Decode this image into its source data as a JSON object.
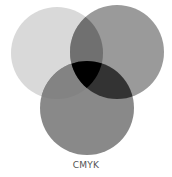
{
  "diagram": {
    "type": "venn",
    "label": "CMYK",
    "circles": [
      {
        "name": "left",
        "cx": 57,
        "cy": 53,
        "r": 46,
        "color": "#d9d9d9"
      },
      {
        "name": "right",
        "cx": 117,
        "cy": 52,
        "r": 47,
        "color": "#9a9a9a"
      },
      {
        "name": "bottom",
        "cx": 87,
        "cy": 108,
        "r": 47,
        "color": "#898989"
      }
    ],
    "overlaps": {
      "left_right": "#707070",
      "left_bottom": "#838383",
      "right_bottom": "#333333",
      "all": "#000000"
    }
  }
}
